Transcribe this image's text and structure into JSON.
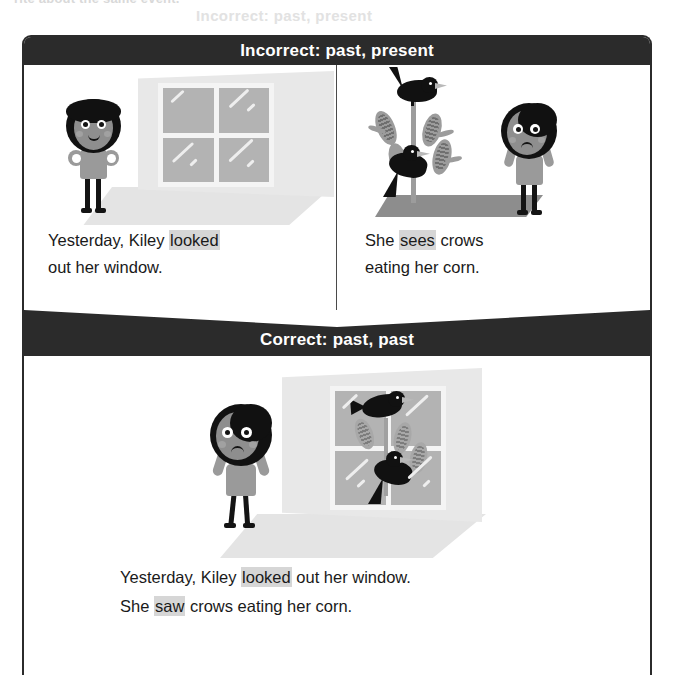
{
  "page": {
    "ghost_text_top": "rite about the same event.",
    "ghost_text_second": "Incorrect: past, present"
  },
  "card": {
    "incorrect_section": {
      "header_label": "Incorrect:  past, present",
      "panels": [
        {
          "id": "panel-looked",
          "illustration_name": "girl-looking-out-window",
          "caption_parts": [
            {
              "text": "Yesterday, Kiley ",
              "highlighted": false
            },
            {
              "text": "looked",
              "highlighted": true
            },
            {
              "text": " out her window.",
              "highlighted": false
            }
          ],
          "caption_line1_pre": "Yesterday, Kiley ",
          "caption_line1_hl": "looked",
          "caption_line2": "out her window."
        },
        {
          "id": "panel-sees",
          "illustration_name": "crows-eating-corn-with-worried-girl",
          "caption_line1_pre": "She ",
          "caption_line1_hl": "sees",
          "caption_line1_post": " crows",
          "caption_line2": "eating her corn."
        }
      ]
    },
    "correct_section": {
      "header_label": "Correct:  past, past",
      "illustration_name": "girl-at-window-watching-crows-on-corn",
      "caption": {
        "line1_pre": "Yesterday, Kiley ",
        "line1_hl": "looked",
        "line1_post": " out her window.",
        "line2_pre": "She ",
        "line2_hl": "saw",
        "line2_post": " crows eating her corn."
      }
    }
  },
  "colors": {
    "bar_background": "#2b2b2b",
    "bar_text": "#ffffff",
    "highlight": "#d6d6d6",
    "border": "#2b2b2b",
    "page_background": "#ffffff"
  }
}
